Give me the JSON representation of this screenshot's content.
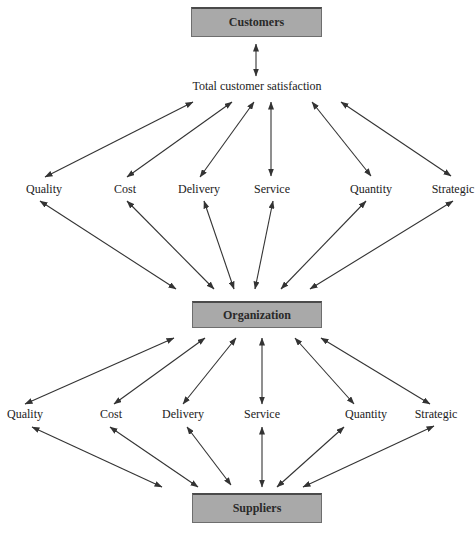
{
  "diagram": {
    "nodes": {
      "customers": "Customers",
      "satisfaction": "Total customer satisfaction",
      "organization": "Organization",
      "suppliers": "Suppliers"
    },
    "upper_factors": [
      "Quality",
      "Cost",
      "Delivery",
      "Service",
      "Quantity",
      "Strategic"
    ],
    "lower_factors": [
      "Quality",
      "Cost",
      "Delivery",
      "Service",
      "Quantity",
      "Strategic"
    ],
    "colors": {
      "box_fill": "#a9a9a9",
      "box_border": "#4a4a4a",
      "arrow": "#333333"
    },
    "edges": [
      {
        "from": "Customers",
        "to": "Total customer satisfaction",
        "type": "bidirectional"
      },
      {
        "from": "Total customer satisfaction",
        "to": "Quality",
        "type": "bidirectional"
      },
      {
        "from": "Total customer satisfaction",
        "to": "Cost",
        "type": "bidirectional"
      },
      {
        "from": "Total customer satisfaction",
        "to": "Delivery",
        "type": "bidirectional"
      },
      {
        "from": "Total customer satisfaction",
        "to": "Service",
        "type": "bidirectional"
      },
      {
        "from": "Total customer satisfaction",
        "to": "Quantity",
        "type": "bidirectional"
      },
      {
        "from": "Total customer satisfaction",
        "to": "Strategic",
        "type": "bidirectional"
      },
      {
        "from": "Quality",
        "to": "Organization",
        "type": "bidirectional"
      },
      {
        "from": "Cost",
        "to": "Organization",
        "type": "bidirectional"
      },
      {
        "from": "Delivery",
        "to": "Organization",
        "type": "bidirectional"
      },
      {
        "from": "Service",
        "to": "Organization",
        "type": "bidirectional"
      },
      {
        "from": "Quantity",
        "to": "Organization",
        "type": "bidirectional"
      },
      {
        "from": "Strategic",
        "to": "Organization",
        "type": "bidirectional"
      },
      {
        "from": "Organization",
        "to": "Quality",
        "type": "bidirectional"
      },
      {
        "from": "Organization",
        "to": "Cost",
        "type": "bidirectional"
      },
      {
        "from": "Organization",
        "to": "Delivery",
        "type": "bidirectional"
      },
      {
        "from": "Organization",
        "to": "Service",
        "type": "bidirectional"
      },
      {
        "from": "Organization",
        "to": "Quantity",
        "type": "bidirectional"
      },
      {
        "from": "Organization",
        "to": "Strategic",
        "type": "bidirectional"
      },
      {
        "from": "Quality",
        "to": "Suppliers",
        "type": "bidirectional"
      },
      {
        "from": "Cost",
        "to": "Suppliers",
        "type": "bidirectional"
      },
      {
        "from": "Delivery",
        "to": "Suppliers",
        "type": "bidirectional"
      },
      {
        "from": "Service",
        "to": "Suppliers",
        "type": "bidirectional"
      },
      {
        "from": "Quantity",
        "to": "Suppliers",
        "type": "bidirectional"
      },
      {
        "from": "Strategic",
        "to": "Suppliers",
        "type": "bidirectional"
      }
    ]
  }
}
